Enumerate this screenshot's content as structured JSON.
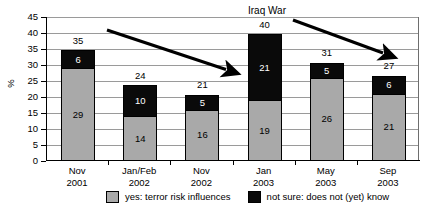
{
  "chart_data": {
    "type": "bar",
    "subtype": "stacked-bar",
    "title": "",
    "xlabel": "",
    "ylabel": "%",
    "ylim": [
      0,
      45
    ],
    "ytick_step": 5,
    "yticks": [
      45,
      40,
      35,
      30,
      25,
      20,
      15,
      10,
      5,
      0
    ],
    "grid": true,
    "legend_position": "bottom",
    "categories": [
      "Nov\n2001",
      "Jan/Feb\n2002",
      "Nov\n2002",
      "Jan\n2003",
      "May\n2003",
      "Sep\n2003"
    ],
    "category_lines": [
      [
        "Nov",
        "2001"
      ],
      [
        "Jan/Feb",
        "2002"
      ],
      [
        "Nov",
        "2002"
      ],
      [
        "Jan",
        "2003"
      ],
      [
        "May",
        "2003"
      ],
      [
        "Sep",
        "2003"
      ]
    ],
    "series": [
      {
        "name": "yes: terror risk influences",
        "color": "#a9a9a9",
        "values": [
          29,
          14,
          16,
          19,
          26,
          21
        ]
      },
      {
        "name": "not sure: does not (yet) know",
        "color": "#0a0a0a",
        "values": [
          6,
          10,
          5,
          21,
          5,
          6
        ]
      }
    ],
    "totals": [
      35,
      24,
      21,
      40,
      31,
      27
    ],
    "annotations": [
      {
        "text": "Iraq War",
        "type": "event-label"
      },
      {
        "text": "",
        "type": "trend-arrow",
        "note": "declining trend arrow over Nov 2001 - Nov 2002"
      },
      {
        "text": "",
        "type": "trend-arrow",
        "note": "declining trend arrow over Jan 2003 - Sep 2003"
      }
    ]
  },
  "legend": {
    "items": [
      {
        "label": "yes: terror risk influences",
        "swatch": "gray"
      },
      {
        "label": "not sure: does not (yet) know",
        "swatch": "black"
      }
    ]
  },
  "annotation": {
    "iraq_war": "Iraq War"
  }
}
